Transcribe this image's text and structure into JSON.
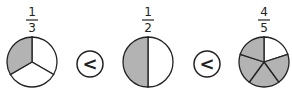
{
  "colors": {
    "shaded": "#b3b3b3",
    "unshaded": "#ffffff",
    "stroke": "#222222"
  },
  "fractions": [
    {
      "numerator": "1",
      "denominator": "3",
      "parts": 5,
      "shaded": 1,
      "label_num": "1",
      "label_den": "3"
    },
    {
      "numerator": "1",
      "denominator": "2",
      "parts": 2,
      "shaded": 1,
      "label_num": "1",
      "label_den": "2"
    },
    {
      "numerator": "4",
      "denominator": "5",
      "parts": 5,
      "shaded": 4,
      "label_num": "4",
      "label_den": "5"
    }
  ],
  "comparisons": [
    {
      "symbol": "<"
    },
    {
      "symbol": "<"
    }
  ]
}
